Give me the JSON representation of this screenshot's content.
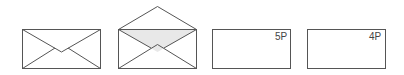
{
  "diagram": {
    "stroke_color": "#555555",
    "flap_fill_color": "#e8e8e8",
    "items": [
      {
        "name": "closed-envelope",
        "label": ""
      },
      {
        "name": "open-envelope",
        "label": ""
      },
      {
        "name": "envelope-back-5p",
        "label": "5P"
      },
      {
        "name": "envelope-back-4p",
        "label": "4P"
      }
    ]
  }
}
